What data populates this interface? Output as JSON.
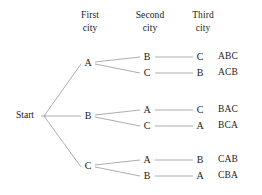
{
  "diagram": {
    "colors": {
      "background": "#ffffff",
      "text": "#1a1a1a",
      "line": "#8a8a8a"
    },
    "headers": [
      {
        "line1": "First",
        "line2": "city",
        "x": 90
      },
      {
        "line1": "Second",
        "line2": "city",
        "x": 150
      },
      {
        "line1": "Third",
        "line2": "city",
        "x": 203
      }
    ],
    "root": {
      "label": "Start",
      "x": 25,
      "y": 116
    },
    "branches": [
      {
        "first_city": "A",
        "first_x": 88,
        "first_y": 63,
        "paths": [
          {
            "second_city": "B",
            "third_city": "C",
            "result": "ABC",
            "y": 57
          },
          {
            "second_city": "C",
            "third_city": "B",
            "result": "ACB",
            "y": 73
          }
        ]
      },
      {
        "first_city": "B",
        "first_x": 88,
        "first_y": 116,
        "paths": [
          {
            "second_city": "A",
            "third_city": "C",
            "result": "BAC",
            "y": 110
          },
          {
            "second_city": "C",
            "third_city": "A",
            "result": "BCA",
            "y": 126
          }
        ]
      },
      {
        "first_city": "C",
        "first_x": 88,
        "first_y": 166,
        "paths": [
          {
            "second_city": "A",
            "third_city": "B",
            "result": "CAB",
            "y": 160
          },
          {
            "second_city": "B",
            "third_city": "A",
            "result": "CBA",
            "y": 176
          }
        ]
      }
    ],
    "columns": {
      "second_x": 147,
      "third_x": 200,
      "result_x": 228
    }
  }
}
